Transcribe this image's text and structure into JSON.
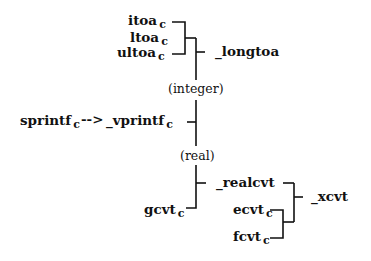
{
  "diagram": {
    "type": "call-hierarchy",
    "nodes": {
      "itoa": {
        "name": "itoa",
        "sub": "c"
      },
      "ltoa": {
        "name": "ltoa",
        "sub": "c"
      },
      "ultoa": {
        "name": "ultoa",
        "sub": "c"
      },
      "longtoa": {
        "name": "_longtoa"
      },
      "integer": {
        "label": "(integer)"
      },
      "sprintf": {
        "name": "sprintf",
        "sub": "c"
      },
      "arrow": {
        "label": "-->"
      },
      "vprintf": {
        "name": "_vprintf",
        "sub": "c"
      },
      "real": {
        "label": "(real)"
      },
      "realcvt": {
        "name": "_realcvt"
      },
      "gcvt": {
        "name": "gcvt",
        "sub": "c"
      },
      "ecvt": {
        "name": "ecvt",
        "sub": "c"
      },
      "fcvt": {
        "name": "fcvt",
        "sub": "c"
      },
      "xcvt": {
        "name": "_xcvt"
      }
    },
    "edges": [
      {
        "from": "itoa",
        "to": "longtoa"
      },
      {
        "from": "ltoa",
        "to": "longtoa"
      },
      {
        "from": "ultoa",
        "to": "longtoa"
      },
      {
        "from": "longtoa",
        "to": "vprintf",
        "label": "(integer)"
      },
      {
        "from": "sprintf",
        "to": "vprintf"
      },
      {
        "from": "vprintf",
        "to": "realcvt",
        "label": "(real)"
      },
      {
        "from": "gcvt",
        "to": "realcvt"
      },
      {
        "from": "realcvt",
        "to": "xcvt"
      },
      {
        "from": "ecvt",
        "to": "xcvt"
      },
      {
        "from": "fcvt",
        "to": "xcvt"
      }
    ]
  }
}
